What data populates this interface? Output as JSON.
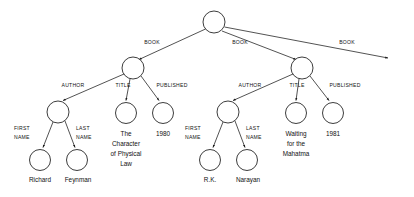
{
  "diagram": {
    "type": "parse-tree",
    "edge_labels": {
      "book": "BOOK",
      "author": "AUTHOR",
      "title": "TITLE",
      "published": "PUBLISHED",
      "first_name_line1": "FIRST",
      "first_name_line2": "NAME",
      "last_name_line1": "LAST",
      "last_name_line2": "NAME"
    },
    "book1": {
      "author": {
        "first_name": "Richard",
        "last_name": "Feynman"
      },
      "title_lines": [
        "The",
        "Character",
        "of Physical",
        "Law"
      ],
      "published": "1980"
    },
    "book2": {
      "author": {
        "first_name": "R.K.",
        "last_name": "Narayan"
      },
      "title_lines": [
        "Waiting",
        "for the",
        "Mahatma"
      ],
      "published": "1981"
    },
    "colors": {
      "stroke": "#1a1a1a",
      "background": "#ffffff",
      "text": "#111111"
    }
  }
}
